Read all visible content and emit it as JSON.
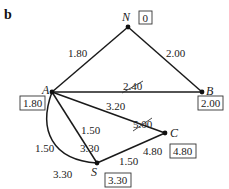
{
  "panel_label": "b",
  "nodes": {
    "N": {
      "name": "N",
      "value": "0"
    },
    "A": {
      "name": "A",
      "value": "1.80"
    },
    "B": {
      "name": "B",
      "value": "2.00"
    },
    "C": {
      "name": "C",
      "value": "4.80"
    },
    "S": {
      "name": "S",
      "value": "3.30"
    }
  },
  "edges": {
    "NA": {
      "from": "N",
      "to": "A",
      "weight": "1.80"
    },
    "NB": {
      "from": "N",
      "to": "B",
      "weight": "2.00"
    },
    "AB": {
      "from": "A",
      "to": "B",
      "weight": "2.40",
      "struck": true
    },
    "AC": {
      "from": "A",
      "to": "C",
      "weight": "3.20"
    },
    "AC_old": {
      "weight": "5.00",
      "struck": true
    },
    "AS_straight": {
      "from": "A",
      "to": "S",
      "weight": "1.50",
      "secondary": "3.30"
    },
    "AS_curved": {
      "from": "A",
      "to": "S",
      "weight": "1.50",
      "secondary": "3.30"
    },
    "SC": {
      "from": "S",
      "to": "C",
      "weight": "1.50",
      "secondary": "4.80"
    }
  }
}
